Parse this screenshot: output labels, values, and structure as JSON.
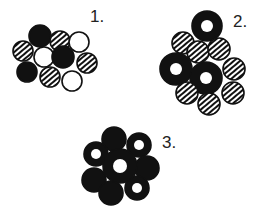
{
  "labels": {
    "one": "1.",
    "two": "2.",
    "three": "3."
  },
  "colors": {
    "ink": "#111111",
    "paper": "#ffffff"
  },
  "clusters": [
    {
      "label": "1.",
      "description": "Mixed packing of solid black, hatched and open white circles",
      "circles": [
        {
          "type": "solid",
          "cx": 40,
          "cy": 36,
          "r": 11
        },
        {
          "type": "hatched",
          "cx": 60,
          "cy": 41,
          "r": 10
        },
        {
          "type": "open",
          "cx": 79,
          "cy": 42,
          "r": 10
        },
        {
          "type": "hatched",
          "cx": 23,
          "cy": 51,
          "r": 10
        },
        {
          "type": "open",
          "cx": 44,
          "cy": 57,
          "r": 10
        },
        {
          "type": "solid",
          "cx": 63,
          "cy": 57,
          "r": 11
        },
        {
          "type": "hatched",
          "cx": 87,
          "cy": 63,
          "r": 10
        },
        {
          "type": "solid",
          "cx": 27,
          "cy": 72,
          "r": 10
        },
        {
          "type": "hatched",
          "cx": 50,
          "cy": 77,
          "r": 10
        },
        {
          "type": "open",
          "cx": 72,
          "cy": 81,
          "r": 10
        }
      ]
    },
    {
      "label": "2.",
      "description": "Hatched circles with three black rings",
      "circles": [
        {
          "type": "ring",
          "cx": 207,
          "cy": 26,
          "r": 15
        },
        {
          "type": "hatched",
          "cx": 183,
          "cy": 43,
          "r": 11
        },
        {
          "type": "hatched",
          "cx": 198,
          "cy": 52,
          "r": 11
        },
        {
          "type": "hatched",
          "cx": 219,
          "cy": 49,
          "r": 11
        },
        {
          "type": "ring",
          "cx": 176,
          "cy": 69,
          "r": 16
        },
        {
          "type": "hatched",
          "cx": 234,
          "cy": 69,
          "r": 11
        },
        {
          "type": "ring",
          "cx": 206,
          "cy": 78,
          "r": 16
        },
        {
          "type": "hatched",
          "cx": 187,
          "cy": 93,
          "r": 11
        },
        {
          "type": "hatched",
          "cx": 233,
          "cy": 93,
          "r": 11
        },
        {
          "type": "hatched",
          "cx": 209,
          "cy": 104,
          "r": 11
        }
      ]
    },
    {
      "label": "3.",
      "description": "Flower-like cluster of black disks, some with holes",
      "circles": [
        {
          "type": "solid",
          "cx": 114,
          "cy": 139,
          "r": 12
        },
        {
          "type": "ring",
          "cx": 139,
          "cy": 145,
          "r": 12
        },
        {
          "type": "ring",
          "cx": 96,
          "cy": 154,
          "r": 12
        },
        {
          "type": "solid",
          "cx": 147,
          "cy": 168,
          "r": 12
        },
        {
          "type": "solid",
          "cx": 94,
          "cy": 180,
          "r": 12
        },
        {
          "type": "ring",
          "cx": 137,
          "cy": 188,
          "r": 12
        },
        {
          "type": "solid",
          "cx": 111,
          "cy": 193,
          "r": 12
        },
        {
          "type": "ring",
          "cx": 120,
          "cy": 166,
          "r": 17
        }
      ]
    }
  ]
}
